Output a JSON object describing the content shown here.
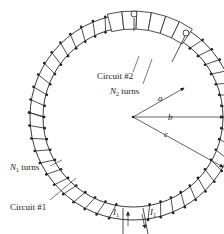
{
  "figure": {
    "type": "toroidal-transformer-diagram",
    "colors": {
      "ink": "#222222",
      "background": "#ffffff"
    },
    "geometry": {
      "center": [
        133,
        117
      ],
      "inner_radius": 90,
      "outer_radius": 103
    }
  },
  "labels": {
    "circuit2": "Circuit #2",
    "n2_turns_sym": "N",
    "n2_turns_sub": "2",
    "n2_turns_word": " turns",
    "a": "a",
    "b": "b",
    "c": "c",
    "n1_turns_sym": "N",
    "n1_turns_sub": "1",
    "n1_turns_word": " turns",
    "circuit1": "Circuit #1",
    "i1_left_sym": "I",
    "i1_left_sub": "1",
    "i1_right_sym": "I",
    "i1_right_sub": "1"
  }
}
